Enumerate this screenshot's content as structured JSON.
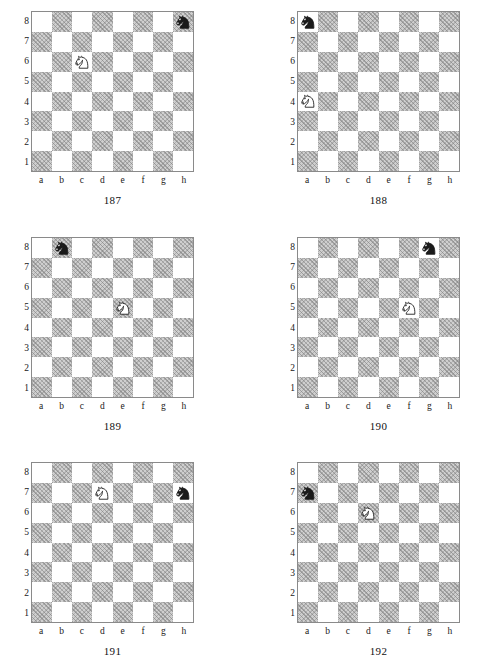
{
  "page": {
    "running_header": "",
    "rank_labels": [
      "8",
      "7",
      "6",
      "5",
      "4",
      "3",
      "2",
      "1"
    ],
    "file_labels": [
      "a",
      "b",
      "c",
      "d",
      "e",
      "f",
      "g",
      "h"
    ],
    "colors": {
      "dark_square": "#cfcfcf",
      "light_square": "#ffffff",
      "board_border": "#8a8a8a",
      "white_piece_fill": "#ffffff",
      "white_piece_stroke": "#222222",
      "black_piece_fill": "#1a1a1a",
      "text": "#1a1a1a"
    }
  },
  "diagrams": [
    {
      "caption": "187",
      "white_knight": "c6",
      "black_knight": "h8",
      "pieces": [
        {
          "square": "c6",
          "color": "white",
          "type": "knight",
          "name": "white-knight"
        },
        {
          "square": "h8",
          "color": "black",
          "type": "knight",
          "name": "black-knight"
        }
      ]
    },
    {
      "caption": "188",
      "white_knight": "a4",
      "black_knight": "a8",
      "pieces": [
        {
          "square": "a4",
          "color": "white",
          "type": "knight",
          "name": "white-knight"
        },
        {
          "square": "a8",
          "color": "black",
          "type": "knight",
          "name": "black-knight"
        }
      ]
    },
    {
      "caption": "189",
      "white_knight": "e5",
      "black_knight": "b8",
      "pieces": [
        {
          "square": "e5",
          "color": "white",
          "type": "knight",
          "name": "white-knight"
        },
        {
          "square": "b8",
          "color": "black",
          "type": "knight",
          "name": "black-knight"
        }
      ]
    },
    {
      "caption": "190",
      "white_knight": "f5",
      "black_knight": "g8",
      "pieces": [
        {
          "square": "f5",
          "color": "white",
          "type": "knight",
          "name": "white-knight"
        },
        {
          "square": "g8",
          "color": "black",
          "type": "knight",
          "name": "black-knight"
        }
      ]
    },
    {
      "caption": "191",
      "white_knight": "d7",
      "black_knight": "h7",
      "pieces": [
        {
          "square": "d7",
          "color": "white",
          "type": "knight",
          "name": "white-knight"
        },
        {
          "square": "h7",
          "color": "black",
          "type": "knight",
          "name": "black-knight"
        }
      ]
    },
    {
      "caption": "192",
      "white_knight": "d6",
      "black_knight": "a7",
      "pieces": [
        {
          "square": "d6",
          "color": "white",
          "type": "knight",
          "name": "white-knight"
        },
        {
          "square": "a7",
          "color": "black",
          "type": "knight",
          "name": "black-knight"
        }
      ]
    }
  ],
  "layout": {
    "columns": 2,
    "rows": 3,
    "positions": [
      {
        "left": 14,
        "top": 11
      },
      {
        "left": 280,
        "top": 11
      },
      {
        "left": 14,
        "top": 237
      },
      {
        "left": 280,
        "top": 237
      },
      {
        "left": 14,
        "top": 462
      },
      {
        "left": 280,
        "top": 462
      }
    ]
  }
}
